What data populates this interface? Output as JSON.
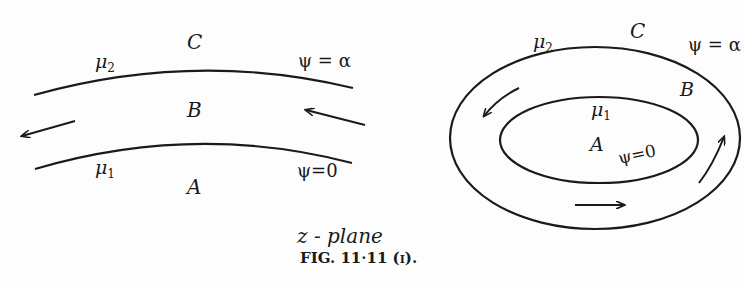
{
  "figure": {
    "plane_label": "z - plane",
    "caption": "FIG. 11·11 (i)."
  },
  "left_diagram": {
    "regions": {
      "top": "C",
      "middle": "B",
      "bottom": "A"
    },
    "upper_curve": {
      "medium": "μ",
      "medium_sub": "2",
      "stream_value": "ψ = α"
    },
    "lower_curve": {
      "medium": "μ",
      "medium_sub": "1",
      "stream_value": "ψ=0"
    },
    "flow_direction": "right-to-left"
  },
  "right_diagram": {
    "regions": {
      "outside": "C",
      "annulus": "B",
      "inside": "A"
    },
    "outer_ellipse": {
      "medium": "μ",
      "medium_sub": "2",
      "stream_value": "ψ = α"
    },
    "inner_ellipse": {
      "medium": "μ",
      "medium_sub": "1",
      "stream_value": "ψ=0"
    },
    "flow_direction": "counter-clockwise"
  },
  "colors": {
    "ink": "#1a1a1a",
    "paper": "#fdfdfd"
  }
}
